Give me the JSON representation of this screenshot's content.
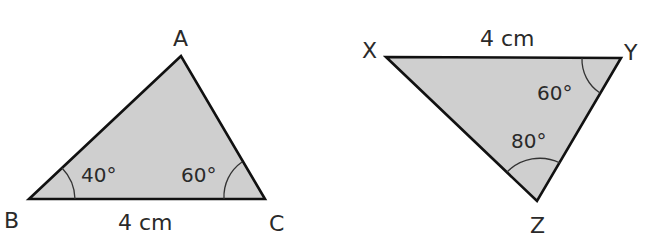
{
  "diagram": {
    "triangle_abc": {
      "vertices": {
        "A": "A",
        "B": "B",
        "C": "C"
      },
      "side_bc": "4 cm",
      "angle_b": "40°",
      "angle_c": "60°"
    },
    "triangle_xyz": {
      "vertices": {
        "X": "X",
        "Y": "Y",
        "Z": "Z"
      },
      "side_xy": "4 cm",
      "angle_y": "60°",
      "angle_z": "80°"
    },
    "colors": {
      "fill": "#cfcfcf",
      "stroke": "#111111",
      "text": "#2a2a2a"
    }
  }
}
